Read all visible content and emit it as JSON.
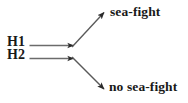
{
  "diagram": {
    "type": "branching-arrow-diagram",
    "background_color": "#ffffff",
    "line_color": "#6b6b6b",
    "arrow_color": "#2b2b2b",
    "text_color": "#191919",
    "hypotheses": [
      {
        "id": "h1",
        "label": "H1"
      },
      {
        "id": "h2",
        "label": "H2"
      }
    ],
    "outcomes": [
      {
        "id": "sea-fight",
        "label": "sea-fight"
      },
      {
        "id": "no-sea-fight",
        "label": "no sea-fight"
      }
    ],
    "edges": [
      {
        "id": "edge-h1-junction",
        "from": "H1",
        "to": "junction",
        "style": "horizontal-arrow"
      },
      {
        "id": "edge-h2-junction",
        "from": "H2",
        "to": "junction",
        "style": "horizontal-arrow"
      },
      {
        "id": "edge-junction-sea-fight",
        "from": "junction",
        "to": "sea-fight",
        "style": "diagonal-arrow-up"
      },
      {
        "id": "edge-junction-no-sea-fight",
        "from": "junction",
        "to": "no sea-fight",
        "style": "diagonal-arrow-down"
      }
    ]
  }
}
